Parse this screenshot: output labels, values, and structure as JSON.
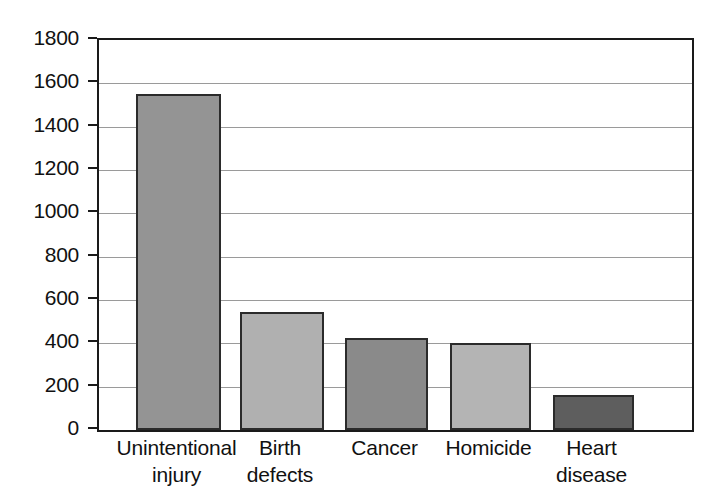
{
  "chart_data": {
    "type": "bar",
    "title": "",
    "subtitle": "",
    "xlabel": "",
    "ylabel": "",
    "categories": [
      "Unintentional injury",
      "Birth defects",
      "Cancer",
      "Homicide",
      "Heart disease"
    ],
    "category_lines": [
      [
        "Unintentional",
        "injury"
      ],
      [
        "Birth",
        "defects"
      ],
      [
        "Cancer",
        ""
      ],
      [
        "Homicide",
        ""
      ],
      [
        "Heart",
        "disease"
      ]
    ],
    "values": [
      1550,
      545,
      425,
      400,
      160
    ],
    "bar_colors": [
      "#949494",
      "#b0b0b0",
      "#8a8a8a",
      "#b4b4b4",
      "#5e5e5e"
    ],
    "bar_edge_color": "#2b2b2b",
    "ylim": [
      0,
      1800
    ],
    "ytick_values": [
      0,
      200,
      400,
      600,
      800,
      1000,
      1200,
      1400,
      1600,
      1800
    ],
    "ytick_labels": [
      "0",
      "200",
      "400",
      "600",
      "800",
      "1000",
      "1200",
      "1400",
      "1600",
      "1800"
    ],
    "grid": true,
    "grid_color": "#9a9a9a",
    "legend": "none",
    "legend_position": "none",
    "axis_color": "#1a1a1a",
    "background_color": "#ffffff"
  }
}
